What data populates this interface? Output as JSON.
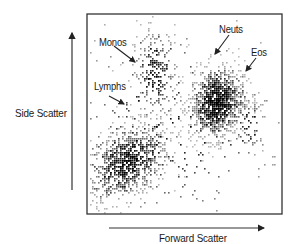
{
  "chart_data": {
    "type": "scatter",
    "title": "",
    "xlabel": "Forward Scatter",
    "ylabel": "Side Scatter",
    "grid": false,
    "legend": null,
    "xlim": [
      0,
      1
    ],
    "ylim": [
      0,
      1
    ],
    "annotations": [
      {
        "text": "Monos",
        "x_px": 99,
        "y_px": 42
      },
      {
        "text": "Lymphs",
        "x_px": 94,
        "y_px": 86
      },
      {
        "text": "Neuts",
        "x_px": 219,
        "y_px": 29
      },
      {
        "text": "Eos",
        "x_px": 251,
        "y_px": 52
      }
    ],
    "series": [
      {
        "name": "Lymphs",
        "cx": 0.2,
        "cy": 0.26,
        "sx": 0.11,
        "sy": 0.09,
        "n": 900,
        "tilt": 0.35
      },
      {
        "name": "Monos",
        "cx": 0.35,
        "cy": 0.7,
        "sx": 0.06,
        "sy": 0.12,
        "n": 260,
        "tilt": 0.0
      },
      {
        "name": "Neuts",
        "cx": 0.66,
        "cy": 0.56,
        "sx": 0.07,
        "sy": 0.09,
        "n": 1100,
        "tilt": 0.2
      },
      {
        "name": "Eos",
        "cx": 0.82,
        "cy": 0.45,
        "sx": 0.05,
        "sy": 0.08,
        "n": 60,
        "tilt": 0.0
      },
      {
        "name": "Debris",
        "cx": 0.45,
        "cy": 0.45,
        "sx": 0.3,
        "sy": 0.28,
        "n": 220,
        "tilt": 0.0
      }
    ]
  },
  "labels": {
    "y_axis": "Side Scatter",
    "x_axis": "Forward Scatter",
    "monos": "Monos",
    "lymphs": "Lymphs",
    "neuts": "Neuts",
    "eos": "Eos"
  }
}
